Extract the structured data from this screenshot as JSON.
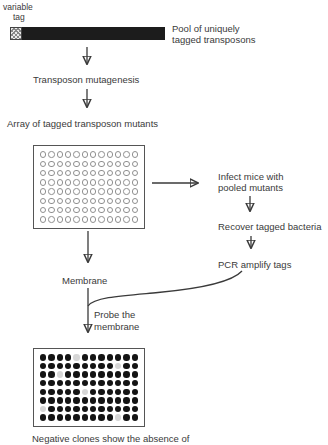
{
  "colors": {
    "background": "#ffffff",
    "text": "#3a3a3a",
    "bar_black": "#1c1c1c",
    "hatch_gray": "#888888",
    "plate_border": "#555555",
    "well_outline": "#8f8f8f",
    "dot_filled": "#141414",
    "dot_negative": "#d6d6d6"
  },
  "labels": {
    "variable_tag_line1": "variable",
    "variable_tag_line2": "tag",
    "pool_line1": "Pool of uniquely",
    "pool_line2": "tagged transposons",
    "transposon_mutagenesis": "Transposon mutagenesis",
    "array_caption": "Array of tagged transposon mutants",
    "infect_line1": "Infect mice with",
    "infect_line2": "pooled mutants",
    "recover": "Recover tagged bacteria",
    "pcr": "PCR amplify tags",
    "membrane": "Membrane",
    "probe_line1": "Probe the",
    "probe_line2": "membrane",
    "negative_caption": "Negative clones show the absence of"
  },
  "plates": {
    "array_plate": {
      "rows": 8,
      "cols": 12,
      "well_style": "open"
    },
    "membrane_plate": {
      "rows": 8,
      "cols": 12,
      "well_style": "filled",
      "negative_wells": [
        [
          1,
          5
        ],
        [
          2,
          10
        ],
        [
          3,
          3
        ],
        [
          5,
          6
        ],
        [
          7,
          1
        ],
        [
          8,
          10
        ]
      ]
    }
  },
  "icons": {
    "arrows": [
      "arrow-down-mutagenesis-top",
      "arrow-down-mutagenesis-bottom",
      "arrow-right-infect",
      "arrow-down-recover",
      "arrow-down-pcr",
      "arrow-down-membrane",
      "arrow-down-probe",
      "curve-pcr-to-membrane"
    ]
  }
}
